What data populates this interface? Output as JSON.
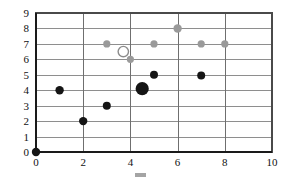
{
  "figure": {
    "width": 284,
    "height": 179,
    "background": "#ffffff"
  },
  "caption": {
    "text": "",
    "note": "clipped-illegible"
  },
  "colors": {
    "dark_series": "#151515",
    "gray_series": "#9a9a9a",
    "open_marker_fill": "#ffffff",
    "open_marker_stroke": "#8c8c8c",
    "gridline": "#8e8e8e",
    "gridline_vertical": "#6f6f6f",
    "frame": "#4a4a4a",
    "axis": "#1a1a1a",
    "tick_text": "#111111"
  },
  "chart_data": {
    "type": "scatter",
    "title": "",
    "subtitle": "",
    "xlabel": "",
    "ylabel": "",
    "xlim": [
      0,
      10
    ],
    "ylim": [
      0,
      9
    ],
    "xticks": [
      0,
      2,
      4,
      6,
      8,
      10
    ],
    "xtick_labels": [
      "0",
      "2",
      "4",
      "6",
      "8",
      "10"
    ],
    "yticks": [
      0,
      1,
      2,
      3,
      4,
      5,
      6,
      7,
      8,
      9
    ],
    "ytick_labels": [
      "0",
      "1",
      "2",
      "3",
      "4",
      "5",
      "6",
      "7",
      "8",
      "9"
    ],
    "grid": true,
    "grid_axis": "both",
    "grid_x_step": 2,
    "grid_y_step": 1,
    "legend": false,
    "legend_position": "none",
    "series": [
      {
        "name": "dark-series",
        "color": "#151515",
        "marker": "circle-filled",
        "points": [
          {
            "x": 0,
            "y": 0,
            "r": 4.2
          },
          {
            "x": 1,
            "y": 4,
            "r": 4.2
          },
          {
            "x": 2,
            "y": 2,
            "r": 4.2
          },
          {
            "x": 3,
            "y": 3,
            "r": 4.0
          },
          {
            "x": 4.5,
            "y": 4.1,
            "r": 6.6
          },
          {
            "x": 5,
            "y": 5,
            "r": 4.0
          },
          {
            "x": 7,
            "y": 4.95,
            "r": 4.0
          }
        ]
      },
      {
        "name": "gray-series",
        "color": "#9a9a9a",
        "marker": "circle-filled",
        "points": [
          {
            "x": 3,
            "y": 7,
            "r": 3.6
          },
          {
            "x": 4,
            "y": 6,
            "r": 3.6
          },
          {
            "x": 5,
            "y": 7,
            "r": 3.6
          },
          {
            "x": 6,
            "y": 8,
            "r": 4.2
          },
          {
            "x": 7,
            "y": 7,
            "r": 3.6
          },
          {
            "x": 8,
            "y": 7,
            "r": 3.6
          }
        ]
      },
      {
        "name": "open-marker-series",
        "color": "#ffffff",
        "marker": "circle-open",
        "points": [
          {
            "x": 3.7,
            "y": 6.5,
            "r": 5.2
          }
        ]
      }
    ]
  }
}
